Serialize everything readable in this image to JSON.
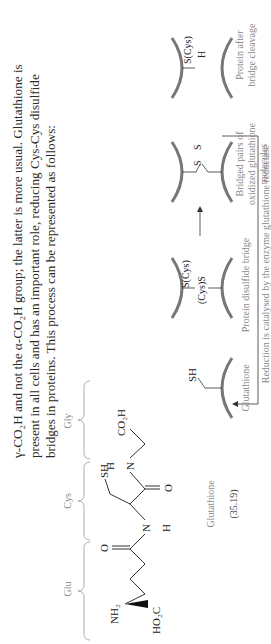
{
  "paragraph": {
    "line1": "γ-CO₂H and not the α-CO₂H group; the latter is more usual. Glutathione is",
    "line2": "present in all cells and has an important role, reducing Cys-Cys disulfide",
    "line3": "bridges in proteins. This process can be represented as follows:"
  },
  "structure": {
    "residues": [
      "Glu",
      "Cys",
      "Gly"
    ],
    "atoms": {
      "nh2": "NH₂",
      "ho2c": "HO₂C",
      "o1": "O",
      "nh1_n": "N",
      "nh1_h": "H",
      "sh": "SH",
      "o2": "O",
      "nh2_n": "N",
      "nh2_h": "H",
      "co2h": "CO₂H"
    },
    "caption": "Glutathione",
    "number": "(35.19)"
  },
  "scheme": {
    "glutathione": {
      "group": "SH",
      "label": "Glutathione"
    },
    "protein_bridge": {
      "top": "(Cys)S",
      "bottom": "S(Cys)",
      "label": "Protein disulfide bridge"
    },
    "bridged_pairs": {
      "s1": "S",
      "s2": "S",
      "label_line1": "Bridged pairs of",
      "label_line2": "oxidized glutathione",
      "label_line3": "molecules"
    },
    "protein_after": {
      "h": "H",
      "s": "S(Cys)",
      "label_line1": "Protein after",
      "label_line2": "bridge cleavage"
    },
    "note": "Reduction is catalysed by the enzyme glutathione reductase"
  }
}
